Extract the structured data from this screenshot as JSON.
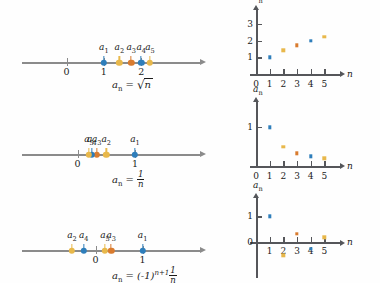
{
  "figure": {
    "colors": {
      "blue": "#2E7EBB",
      "gold": "#E8B84B",
      "orange": "#D97B2E",
      "axis_gray": "#8b8b8b",
      "axis_dark": "#55565a"
    },
    "rows": [
      {
        "id": "sqrt-n",
        "formula_parts": {
          "lhs": "a",
          "sub": "n",
          "eq": "=",
          "radicand": "n"
        },
        "numberline": {
          "ticks": [
            {
              "label": "0",
              "value": 0
            },
            {
              "label": "1",
              "value": 1
            },
            {
              "label": "2",
              "value": 2
            }
          ],
          "points": [
            {
              "label": "a",
              "sub": "1",
              "value": 1.0,
              "color": "#2E7EBB"
            },
            {
              "label": "a",
              "sub": "2",
              "value": 1.414,
              "color": "#E8B84B"
            },
            {
              "label": "a",
              "sub": "3",
              "value": 1.732,
              "color": "#D97B2E"
            },
            {
              "label": "a",
              "sub": "4",
              "value": 2.0,
              "color": "#2E7EBB"
            },
            {
              "label": "a",
              "sub": "5",
              "value": 2.236,
              "color": "#E8B84B"
            }
          ]
        },
        "plot": {
          "yaxis_name": "a",
          "yaxis_sub": "n",
          "xaxis_name": "n",
          "xticks": [
            "0",
            "1",
            "2",
            "3",
            "4",
            "5"
          ],
          "yticks": [
            "1",
            "2",
            "3"
          ],
          "xlim": [
            0,
            6
          ],
          "ylim": [
            0,
            3.6
          ],
          "points": [
            {
              "n": 1,
              "a": 1.0,
              "color": "#2E7EBB"
            },
            {
              "n": 2,
              "a": 1.414,
              "color": "#E8B84B"
            },
            {
              "n": 3,
              "a": 1.732,
              "color": "#D97B2E"
            },
            {
              "n": 4,
              "a": 2.0,
              "color": "#2E7EBB"
            },
            {
              "n": 5,
              "a": 2.236,
              "color": "#E8B84B"
            }
          ]
        }
      },
      {
        "id": "one-over-n",
        "formula_parts": {
          "lhs": "a",
          "sub": "n",
          "eq": "=",
          "num": "1",
          "den": "n"
        },
        "numberline": {
          "ticks": [
            {
              "label": "0",
              "value": 0
            },
            {
              "label": "1",
              "value": 1
            }
          ],
          "points": [
            {
              "label": "a",
              "sub": "1",
              "value": 1.0,
              "color": "#2E7EBB"
            },
            {
              "label": "a",
              "sub": "2",
              "value": 0.5,
              "color": "#E8B84B"
            },
            {
              "label": "a",
              "sub": "3",
              "value": 0.333,
              "color": "#D97B2E"
            },
            {
              "label": "a",
              "sub": "4",
              "value": 0.25,
              "color": "#2E7EBB"
            },
            {
              "label": "a",
              "sub": "5",
              "value": 0.2,
              "color": "#E8B84B"
            }
          ]
        },
        "plot": {
          "yaxis_name": "a",
          "yaxis_sub": "n",
          "xaxis_name": "n",
          "xticks": [
            "0",
            "1",
            "2",
            "3",
            "4",
            "5"
          ],
          "yticks": [
            "1"
          ],
          "xlim": [
            0,
            6
          ],
          "ylim": [
            0,
            1.55
          ],
          "points": [
            {
              "n": 1,
              "a": 1.0,
              "color": "#2E7EBB"
            },
            {
              "n": 2,
              "a": 0.5,
              "color": "#E8B84B"
            },
            {
              "n": 3,
              "a": 0.333,
              "color": "#D97B2E"
            },
            {
              "n": 4,
              "a": 0.25,
              "color": "#2E7EBB"
            },
            {
              "n": 5,
              "a": 0.2,
              "color": "#E8B84B"
            }
          ]
        }
      },
      {
        "id": "alternating-one-over-n",
        "formula_parts": {
          "lhs": "a",
          "sub": "n",
          "eq": "=",
          "base": "(-1)",
          "exp": "n+1",
          "num": "1",
          "den": "n"
        },
        "numberline": {
          "ticks": [
            {
              "label": "0",
              "value": 0
            },
            {
              "label": "1",
              "value": 1
            }
          ],
          "points": [
            {
              "label": "a",
              "sub": "1",
              "value": 1.0,
              "color": "#2E7EBB"
            },
            {
              "label": "a",
              "sub": "2",
              "value": -0.5,
              "color": "#E8B84B"
            },
            {
              "label": "a",
              "sub": "3",
              "value": 0.333,
              "color": "#D97B2E"
            },
            {
              "label": "a",
              "sub": "4",
              "value": -0.25,
              "color": "#2E7EBB"
            },
            {
              "label": "a",
              "sub": "5",
              "value": 0.2,
              "color": "#E8B84B"
            }
          ]
        },
        "plot": {
          "yaxis_name": "a",
          "yaxis_sub": "n",
          "xaxis_name": "n",
          "xticks": [
            "1",
            "2",
            "3",
            "4",
            "5"
          ],
          "yticks": [
            "1",
            "0"
          ],
          "xlim": [
            0,
            6
          ],
          "ylim": [
            -0.75,
            1.55
          ],
          "points": [
            {
              "n": 1,
              "a": 1.0,
              "color": "#2E7EBB"
            },
            {
              "n": 2,
              "a": -0.5,
              "color": "#E8B84B"
            },
            {
              "n": 3,
              "a": 0.333,
              "color": "#D97B2E"
            },
            {
              "n": 4,
              "a": -0.25,
              "color": "#2E7EBB"
            },
            {
              "n": 5,
              "a": 0.2,
              "color": "#E8B84B"
            }
          ]
        }
      }
    ]
  }
}
